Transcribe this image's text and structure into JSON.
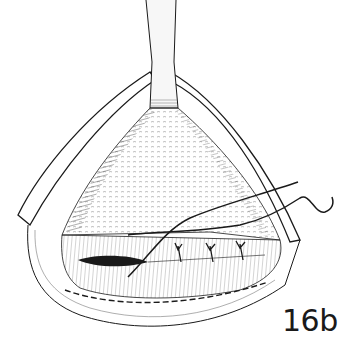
{
  "figure": {
    "label": "16b",
    "colors": {
      "ink": "#1a1a1a",
      "background": "#ffffff",
      "retractor": "#f4f4f4"
    }
  }
}
